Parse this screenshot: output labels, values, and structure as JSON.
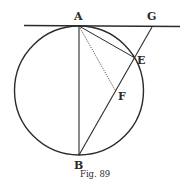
{
  "figure": {
    "caption": "Fig. 89",
    "colors": {
      "ink": "#2b2b2b",
      "background": "#ffffff"
    },
    "circle": {
      "cx": 79,
      "cy": 90.5,
      "r": 64.5
    },
    "points": {
      "A": {
        "label": "A",
        "x": 79,
        "y": 26
      },
      "B": {
        "label": "B",
        "x": 79,
        "y": 155
      },
      "E": {
        "label": "E",
        "x": 135,
        "y": 58
      },
      "F": {
        "label": "F",
        "x": 115,
        "y": 90
      },
      "G": {
        "label": "G",
        "x": 152,
        "y": 27
      }
    },
    "lines": [
      {
        "name": "tangent-line",
        "from": [
          24,
          25
        ],
        "to": [
          180,
          27
        ],
        "style": "solid"
      },
      {
        "name": "diameter-AB",
        "from": "A",
        "to": "B",
        "style": "solid"
      },
      {
        "name": "chord-AE",
        "from": "A",
        "to": "E",
        "style": "solid"
      },
      {
        "name": "line-BG",
        "from": "B",
        "to": "G",
        "style": "solid"
      },
      {
        "name": "perpendicular-AF",
        "from": "A",
        "to": "F",
        "style": "dotted"
      }
    ]
  }
}
